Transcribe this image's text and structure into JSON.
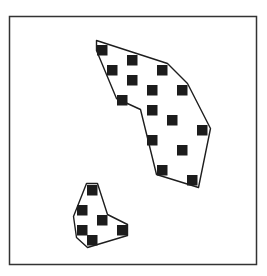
{
  "diagram": {
    "title": "",
    "colors": {
      "background": "#ffffff",
      "frame": "#333333",
      "outline": "#1e1e1e",
      "point": "#1c1c1c"
    },
    "grid_units": "cells of the underlying point grid (column, row)",
    "clusters": [
      {
        "id": "cluster-large",
        "points": [
          {
            "col": 0,
            "row": 0
          },
          {
            "col": 3,
            "row": 1
          },
          {
            "col": 1,
            "row": 2
          },
          {
            "col": 6,
            "row": 2
          },
          {
            "col": 3,
            "row": 3
          },
          {
            "col": 5,
            "row": 4
          },
          {
            "col": 8,
            "row": 4
          },
          {
            "col": 2,
            "row": 5
          },
          {
            "col": 5,
            "row": 6
          },
          {
            "col": 7,
            "row": 7
          },
          {
            "col": 10,
            "row": 8
          },
          {
            "col": 5,
            "row": 9
          },
          {
            "col": 8,
            "row": 10
          },
          {
            "col": 6,
            "row": 12
          },
          {
            "col": 9,
            "row": 13
          }
        ],
        "hull": [
          {
            "col": -0.05,
            "row": -0.45
          },
          {
            "col": 7.05,
            "row": 1.85
          },
          {
            "col": 9.05,
            "row": 3.85
          },
          {
            "col": 11.35,
            "row": 8.35
          },
          {
            "col": 10.15,
            "row": 14.25
          },
          {
            "col": 5.95,
            "row": 12.95
          },
          {
            "col": 4.35,
            "row": 6.45
          },
          {
            "col": 1.95,
            "row": 5.35
          },
          {
            "col": -0.05,
            "row": 0.55
          }
        ]
      },
      {
        "id": "cluster-small",
        "points": [
          {
            "col": -1,
            "row": 14
          },
          {
            "col": -2,
            "row": 16
          },
          {
            "col": 0,
            "row": 17
          },
          {
            "col": -2,
            "row": 18
          },
          {
            "col": 2,
            "row": 18
          },
          {
            "col": -1,
            "row": 19
          }
        ],
        "hull": [
          {
            "col": -1.05,
            "row": 13.85
          },
          {
            "col": 0.05,
            "row": 13.85
          },
          {
            "col": 1.05,
            "row": 16.95
          },
          {
            "col": 3.05,
            "row": 17.95
          },
          {
            "col": 3.05,
            "row": 19.05
          },
          {
            "col": -0.95,
            "row": 20.25
          },
          {
            "col": -2.05,
            "row": 19.25
          },
          {
            "col": -2.35,
            "row": 17.15
          }
        ]
      }
    ]
  }
}
